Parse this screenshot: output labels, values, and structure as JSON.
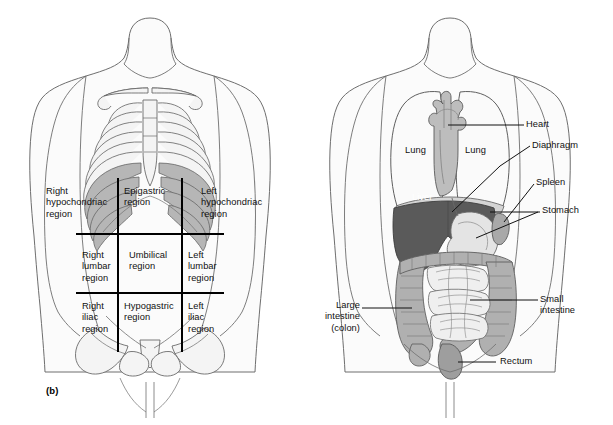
{
  "figure": {
    "background_color": "#ffffff",
    "ink_color": "#111111"
  },
  "panels": [
    {
      "id": "b",
      "caption": "(b)",
      "subject": "Nine abdominopelvic regions of the anterior trunk",
      "grid": {
        "vertical_lines": 2,
        "horizontal_lines": 2,
        "line_color": "#000000"
      }
    },
    {
      "id": "c",
      "caption": "(c)",
      "subject": "Organs of the thoracic and abdominopelvic cavities",
      "leader_line_color": "#111111"
    }
  ],
  "regions": {
    "top_row": [
      {
        "name": "right-hypochondriac",
        "lines": "Right\nhypochondriac\nregion"
      },
      {
        "name": "epigastric",
        "lines": "Epigastric\nregion"
      },
      {
        "name": "left-hypochondriac",
        "lines": "Left\nhypochondriac\nregion"
      }
    ],
    "middle_row": [
      {
        "name": "right-lumbar",
        "lines": "Right\nlumbar\nregion"
      },
      {
        "name": "umbilical",
        "lines": "Umbilical\nregion"
      },
      {
        "name": "left-lumbar",
        "lines": "Left\nlumbar\nregion"
      }
    ],
    "bottom_row": [
      {
        "name": "right-iliac",
        "lines": "Right\niliac\nregion"
      },
      {
        "name": "hypogastric",
        "lines": "Hypogastric\nregion"
      },
      {
        "name": "left-iliac",
        "lines": "Left\niliac\nregion"
      }
    ]
  },
  "organs": [
    {
      "name": "heart",
      "label": "Heart",
      "side": "right",
      "has_leader": true
    },
    {
      "name": "lung-right",
      "label": "Lung",
      "side": "internal",
      "has_leader": false
    },
    {
      "name": "lung-left",
      "label": "Lung",
      "side": "internal",
      "has_leader": false
    },
    {
      "name": "diaphragm",
      "label": "Diaphragm",
      "side": "right",
      "has_leader": true
    },
    {
      "name": "spleen",
      "label": "Spleen",
      "side": "right",
      "has_leader": true
    },
    {
      "name": "stomach",
      "label": "Stomach",
      "side": "right",
      "has_leader": true
    },
    {
      "name": "liver",
      "label": "Liver",
      "side": "internal",
      "has_leader": false,
      "text_color": "#ffffff"
    },
    {
      "name": "small-intestine",
      "label": "Small\nintestine",
      "side": "right",
      "has_leader": true
    },
    {
      "name": "large-intestine",
      "label": "Large\nintestine\n(colon)",
      "side": "left",
      "has_leader": true
    },
    {
      "name": "rectum",
      "label": "Rectum",
      "side": "right",
      "has_leader": true
    }
  ],
  "colors": {
    "body_outline": "#6e6e6e",
    "body_fill": "#fbfbfb",
    "bone_fill": "#f4f4f4",
    "bone_outline": "#6b6b6b",
    "rib_shaded": "#b6b6b6",
    "liver_fill": "#5a5a5a",
    "heart_fill": "#bdbdbd",
    "lung_fill": "#fafafa",
    "stomach_fill": "#d8d8d8",
    "spleen_fill": "#a9a9a9",
    "large_intestine_fill": "#b0b0b0",
    "small_intestine_fill": "#efefef",
    "grid_line": "#000000"
  }
}
